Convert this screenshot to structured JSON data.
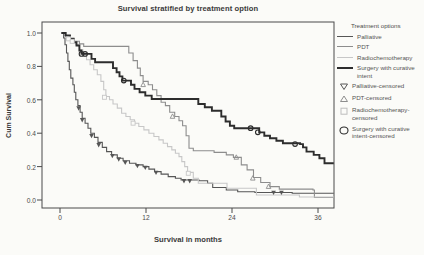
{
  "chart": {
    "title": "Survival stratified by treatment option",
    "xlabel": "Survival in months",
    "ylabel": "Cum Survival",
    "frame_color": "#4a4a4a",
    "legend": {
      "title": "Treatment options",
      "line_entries": [
        {
          "label": "Palliative",
          "color": "#565656",
          "width": 1.2
        },
        {
          "label": "PDT",
          "color": "#8d8d8d",
          "width": 1.2
        },
        {
          "label": "Radiochemotherapy",
          "color": "#c7c7c7",
          "width": 1.2
        },
        {
          "label": "Surgery with curative intent",
          "color": "#2d2d2d",
          "width": 2
        }
      ],
      "marker_entries": [
        {
          "label": "Palliative-censored",
          "marker": "triangle-down",
          "color": "#565656"
        },
        {
          "label": "PDT-censored",
          "marker": "triangle-up",
          "color": "#8d8d8d"
        },
        {
          "label": "Radiochemotherapy-censored",
          "marker": "square",
          "color": "#bdbdbd"
        },
        {
          "label": "Surgery with curative intent-censored",
          "marker": "circle",
          "color": "#2d2d2d"
        }
      ]
    }
  },
  "chart_data": {
    "type": "line",
    "subtype": "kaplan-meier-step",
    "title": "Survival stratified by treatment option",
    "xlabel": "Survival in months",
    "ylabel": "Cum Survival",
    "grid": false,
    "legend_position": "right",
    "xlim": [
      -2.5,
      38.2
    ],
    "ylim": [
      -0.05,
      1.07
    ],
    "xticks": {
      "labels": [
        "0",
        "12",
        "24",
        "36"
      ],
      "values": [
        0,
        12,
        24,
        36
      ]
    },
    "yticks": {
      "labels": [
        "1.0",
        "0.8",
        "0.6",
        "0.4",
        "0.2",
        "0.0"
      ],
      "values": [
        1.0,
        0.8,
        0.6,
        0.4,
        0.2,
        0.0
      ]
    },
    "series": [
      {
        "name": "Palliative",
        "color": "#565656",
        "width": 1.1,
        "marker": "triangle-down",
        "points": [
          [
            0.2,
            1.0
          ],
          [
            0.5,
            0.97
          ],
          [
            0.7,
            0.93
          ],
          [
            0.9,
            0.88
          ],
          [
            1.1,
            0.83
          ],
          [
            1.3,
            0.78
          ],
          [
            1.5,
            0.73
          ],
          [
            1.8,
            0.69
          ],
          [
            2.0,
            0.645
          ],
          [
            2.2,
            0.6
          ],
          [
            2.5,
            0.565
          ],
          [
            2.8,
            0.525
          ],
          [
            3.1,
            0.49
          ],
          [
            3.5,
            0.46
          ],
          [
            3.9,
            0.43
          ],
          [
            4.3,
            0.4
          ],
          [
            4.8,
            0.375
          ],
          [
            5.3,
            0.345
          ],
          [
            5.9,
            0.315
          ],
          [
            6.5,
            0.29
          ],
          [
            7.2,
            0.27
          ],
          [
            8.0,
            0.25
          ],
          [
            8.8,
            0.235
          ],
          [
            9.7,
            0.22
          ],
          [
            10.6,
            0.21
          ],
          [
            11.6,
            0.2
          ],
          [
            12.4,
            0.185
          ],
          [
            13.2,
            0.17
          ],
          [
            14.1,
            0.155
          ],
          [
            15.1,
            0.14
          ],
          [
            16.1,
            0.13
          ],
          [
            16.9,
            0.12
          ],
          [
            19.4,
            0.115
          ],
          [
            20.6,
            0.1
          ],
          [
            21.3,
            0.075
          ],
          [
            23.2,
            0.06
          ],
          [
            24.8,
            0.05
          ],
          [
            27.2,
            0.045
          ],
          [
            31.8,
            0.045
          ],
          [
            32.4,
            0.04
          ],
          [
            38.2,
            0.04
          ]
        ],
        "censored": [
          [
            2.6,
            0.55
          ],
          [
            3.1,
            0.48
          ],
          [
            4.4,
            0.385
          ],
          [
            5.4,
            0.33
          ],
          [
            7.3,
            0.265
          ],
          [
            8.2,
            0.245
          ],
          [
            9.1,
            0.225
          ],
          [
            10.8,
            0.205
          ],
          [
            11.9,
            0.195
          ],
          [
            13.4,
            0.165
          ],
          [
            17.3,
            0.115
          ],
          [
            18.1,
            0.115
          ],
          [
            29.8,
            0.045
          ],
          [
            30.9,
            0.045
          ]
        ]
      },
      {
        "name": "PDT",
        "color": "#8d8d8d",
        "width": 1.1,
        "marker": "triangle-up",
        "points": [
          [
            0.2,
            1.0
          ],
          [
            0.6,
            0.985
          ],
          [
            1.2,
            0.965
          ],
          [
            2.0,
            0.95
          ],
          [
            2.7,
            0.935
          ],
          [
            3.3,
            0.92
          ],
          [
            9.3,
            0.92
          ],
          [
            9.6,
            0.88
          ],
          [
            10.2,
            0.835
          ],
          [
            10.8,
            0.79
          ],
          [
            11.2,
            0.745
          ],
          [
            11.6,
            0.71
          ],
          [
            12.3,
            0.69
          ],
          [
            12.9,
            0.66
          ],
          [
            13.5,
            0.625
          ],
          [
            14.1,
            0.585
          ],
          [
            14.7,
            0.565
          ],
          [
            15.3,
            0.525
          ],
          [
            16.0,
            0.5
          ],
          [
            16.6,
            0.475
          ],
          [
            17.1,
            0.445
          ],
          [
            17.6,
            0.385
          ],
          [
            18.0,
            0.31
          ],
          [
            18.6,
            0.295
          ],
          [
            21.5,
            0.285
          ],
          [
            23.2,
            0.27
          ],
          [
            24.2,
            0.255
          ],
          [
            25.3,
            0.21
          ],
          [
            26.1,
            0.18
          ],
          [
            27.0,
            0.135
          ],
          [
            28.0,
            0.105
          ],
          [
            29.3,
            0.08
          ],
          [
            30.6,
            0.065
          ],
          [
            35.3,
            0.06
          ],
          [
            35.5,
            0.015
          ],
          [
            38.2,
            0.015
          ]
        ],
        "censored": [
          [
            11.6,
            0.69
          ],
          [
            15.7,
            0.5
          ],
          [
            24.6,
            0.255
          ],
          [
            26.9,
            0.13
          ],
          [
            29.1,
            0.08
          ]
        ]
      },
      {
        "name": "Radiochemotherapy",
        "color": "#c7c7c7",
        "width": 1.1,
        "marker": "square",
        "points": [
          [
            0.2,
            1.0
          ],
          [
            0.7,
            0.98
          ],
          [
            1.1,
            0.965
          ],
          [
            1.6,
            0.95
          ],
          [
            2.2,
            0.93
          ],
          [
            2.7,
            0.9
          ],
          [
            3.2,
            0.87
          ],
          [
            3.7,
            0.84
          ],
          [
            4.2,
            0.81
          ],
          [
            4.7,
            0.78
          ],
          [
            5.2,
            0.75
          ],
          [
            5.7,
            0.71
          ],
          [
            6.1,
            0.66
          ],
          [
            6.4,
            0.62
          ],
          [
            6.9,
            0.6
          ],
          [
            7.4,
            0.575
          ],
          [
            8.0,
            0.55
          ],
          [
            8.6,
            0.52
          ],
          [
            9.2,
            0.5
          ],
          [
            9.8,
            0.48
          ],
          [
            10.4,
            0.46
          ],
          [
            11.0,
            0.44
          ],
          [
            11.7,
            0.42
          ],
          [
            12.4,
            0.4
          ],
          [
            13.1,
            0.38
          ],
          [
            13.8,
            0.36
          ],
          [
            14.4,
            0.34
          ],
          [
            15.0,
            0.32
          ],
          [
            15.6,
            0.3
          ],
          [
            16.1,
            0.28
          ],
          [
            16.6,
            0.26
          ],
          [
            17.0,
            0.23
          ],
          [
            17.4,
            0.2
          ],
          [
            17.8,
            0.165
          ],
          [
            18.6,
            0.13
          ],
          [
            19.3,
            0.1
          ],
          [
            22.9,
            0.1
          ],
          [
            23.3,
            0.07
          ],
          [
            27.0,
            0.07
          ],
          [
            27.4,
            0.03
          ],
          [
            33.0,
            0.03
          ],
          [
            33.4,
            0.018
          ],
          [
            38.2,
            0.018
          ]
        ],
        "censored": [
          [
            1.2,
            0.965
          ],
          [
            1.7,
            0.95
          ],
          [
            6.2,
            0.615
          ],
          [
            10.2,
            0.46
          ],
          [
            17.9,
            0.16
          ]
        ]
      },
      {
        "name": "Surgery with curative intent",
        "color": "#2d2d2d",
        "width": 1.9,
        "marker": "circle",
        "points": [
          [
            0.2,
            1.0
          ],
          [
            0.8,
            0.985
          ],
          [
            1.4,
            0.965
          ],
          [
            1.9,
            0.945
          ],
          [
            2.3,
            0.925
          ],
          [
            2.7,
            0.895
          ],
          [
            3.0,
            0.875
          ],
          [
            4.1,
            0.875
          ],
          [
            4.4,
            0.845
          ],
          [
            4.9,
            0.825
          ],
          [
            7.1,
            0.825
          ],
          [
            7.4,
            0.79
          ],
          [
            7.9,
            0.765
          ],
          [
            8.3,
            0.74
          ],
          [
            8.7,
            0.715
          ],
          [
            9.6,
            0.715
          ],
          [
            9.9,
            0.69
          ],
          [
            10.4,
            0.665
          ],
          [
            11.1,
            0.645
          ],
          [
            11.9,
            0.625
          ],
          [
            12.8,
            0.605
          ],
          [
            18.9,
            0.605
          ],
          [
            19.3,
            0.575
          ],
          [
            20.2,
            0.555
          ],
          [
            21.2,
            0.535
          ],
          [
            22.5,
            0.5
          ],
          [
            23.1,
            0.47
          ],
          [
            23.7,
            0.445
          ],
          [
            24.3,
            0.43
          ],
          [
            27.2,
            0.43
          ],
          [
            27.8,
            0.405
          ],
          [
            28.5,
            0.385
          ],
          [
            29.3,
            0.37
          ],
          [
            30.2,
            0.355
          ],
          [
            31.1,
            0.34
          ],
          [
            33.5,
            0.335
          ],
          [
            33.9,
            0.315
          ],
          [
            34.4,
            0.29
          ],
          [
            35.4,
            0.27
          ],
          [
            36.2,
            0.25
          ],
          [
            36.9,
            0.22
          ],
          [
            38.2,
            0.22
          ]
        ],
        "censored": [
          [
            3.0,
            0.875
          ],
          [
            3.5,
            0.875
          ],
          [
            8.9,
            0.715
          ],
          [
            26.6,
            0.43
          ],
          [
            27.6,
            0.405
          ],
          [
            32.8,
            0.335
          ]
        ]
      }
    ]
  }
}
